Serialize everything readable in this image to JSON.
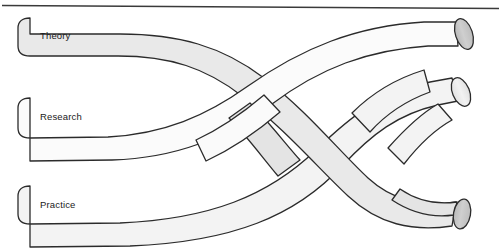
{
  "diagram": {
    "type": "braid-ribbon-diagram",
    "canvas": {
      "width": 501,
      "height": 249,
      "background": "#ffffff"
    },
    "top_rule": {
      "name": "top-horizontal-rule",
      "color": "#3a3a3a",
      "thickness": 1.6
    },
    "style": {
      "stroke_color": "#2b2b2b",
      "stroke_width": 1.3,
      "fill_light": "#fbfbfb",
      "fill_mid": "#f1f1f1",
      "fill_shaded": "#e6e6e6",
      "fill_endcap": "#c9c9c9",
      "fill_endcap_light": "#ededed"
    },
    "strands": [
      {
        "id": "theory",
        "label": "Theory",
        "label_x": 40,
        "label_y": 39,
        "fill": "#e9e9e9",
        "entry_side": "left",
        "entry_y": 36,
        "exit_side": "right",
        "exit_y": 135,
        "cap_left": "rounded",
        "cap_right": "cylinder"
      },
      {
        "id": "research",
        "label": "Research",
        "label_x": 40,
        "label_y": 120,
        "fill": "#fbfbfb",
        "entry_side": "left",
        "entry_y": 116,
        "exit_side": "right",
        "exit_y": 42,
        "cap_left": "rounded",
        "cap_right": "cylinder"
      },
      {
        "id": "practice",
        "label": "Practice",
        "label_x": 40,
        "label_y": 208,
        "fill": "#f4f4f4",
        "entry_side": "left",
        "entry_y": 204,
        "exit_side": "right",
        "exit_y": 212,
        "cap_left": "rounded",
        "cap_right": "cylinder"
      }
    ],
    "end_caps": [
      {
        "id": "endcap-top",
        "cx": 468,
        "cy": 40,
        "rx": 8,
        "ry": 17,
        "rotate": -22
      },
      {
        "id": "endcap-middle",
        "cx": 470,
        "cy": 136,
        "rx": 8,
        "ry": 16,
        "rotate": -16
      },
      {
        "id": "endcap-bottom",
        "cx": 464,
        "cy": 213,
        "rx": 8,
        "ry": 17,
        "rotate": 8
      }
    ]
  }
}
